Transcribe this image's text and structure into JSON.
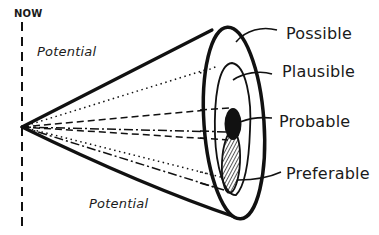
{
  "diagram": {
    "timeline_label": "NOW",
    "cone_labels": {
      "top": "Potential",
      "bottom": "Potential"
    },
    "ring_labels": [
      {
        "id": "possible",
        "label": "Possible"
      },
      {
        "id": "plausible",
        "label": "Plausible"
      },
      {
        "id": "probable",
        "label": "Probable"
      },
      {
        "id": "preferable",
        "label": "Preferable"
      }
    ],
    "colors": {
      "ink": "#111111",
      "background": "#ffffff"
    }
  }
}
